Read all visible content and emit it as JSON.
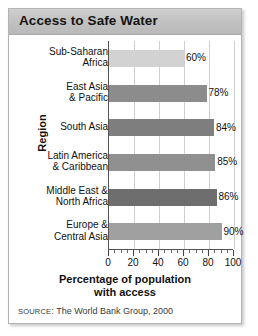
{
  "figure": {
    "title": "Access to Safe Water",
    "source_prefix": "SOURCE",
    "source_separator": ": ",
    "source_text": "The World Bank Group, 2000"
  },
  "chart_data": {
    "type": "bar",
    "orientation": "horizontal",
    "title": "Access to Safe Water",
    "xlabel_line1": "Percentage of population",
    "xlabel_line2": "with access",
    "ylabel": "Region",
    "categories": [
      "Sub-Saharan Africa",
      "East Asia & Pacific",
      "South Asia",
      "Latin America & Caribbean",
      "Middle East & North Africa",
      "Europe & Central Asia"
    ],
    "category_lines": [
      [
        "Sub-Saharan",
        "Africa"
      ],
      [
        "East Asia",
        "& Pacific"
      ],
      [
        "South Asia"
      ],
      [
        "Latin America",
        "& Caribbean"
      ],
      [
        "Middle East &",
        "North Africa"
      ],
      [
        "Europe &",
        "Central Asia"
      ]
    ],
    "values": [
      60,
      78,
      84,
      85,
      86,
      90
    ],
    "value_labels": [
      "60%",
      "78%",
      "84%",
      "85%",
      "86%",
      "90%"
    ],
    "bar_colors": [
      "#d2d2d2",
      "#8c8c8c",
      "#7e7e7e",
      "#909090",
      "#6e6e6e",
      "#a0a0a0"
    ],
    "xlim": [
      0,
      100
    ],
    "xticks": [
      0,
      20,
      40,
      60,
      80,
      100
    ],
    "xtick_labels": [
      "0",
      "20",
      "40",
      "60",
      "80",
      "100"
    ],
    "xminor_step": 5,
    "grid": "vertical",
    "legend": "none",
    "source": "SOURCE: The World Bank Group, 2000"
  }
}
